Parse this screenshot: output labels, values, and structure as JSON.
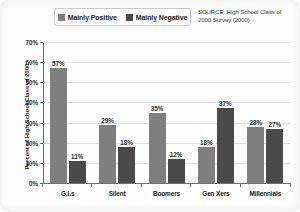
{
  "chart_data": {
    "type": "bar",
    "title": "",
    "xlabel": "",
    "ylabel": "Percent of High School Class of 2000",
    "ylim": [
      0,
      70
    ],
    "ytick_labels": [
      "70%",
      "60%",
      "50%",
      "40%",
      "30%",
      "20%",
      "10%",
      "0%"
    ],
    "ytick_values": [
      70,
      60,
      50,
      40,
      30,
      20,
      10,
      0
    ],
    "grid": true,
    "legend_position": "top-center",
    "categories": [
      "G.I.s",
      "Silent",
      "Boomers",
      "Gen Xers",
      "Millennials"
    ],
    "series": [
      {
        "name": "Mainly Positive",
        "color": "#7f7f7f",
        "values": [
          57,
          29,
          35,
          18,
          28
        ],
        "labels": [
          "57%",
          "29%",
          "35%",
          "18%",
          "28%"
        ]
      },
      {
        "name": "Mainly Negative",
        "color": "#4a4a4a",
        "values": [
          11,
          18,
          12,
          37,
          27
        ],
        "labels": [
          "11%",
          "18%",
          "12%",
          "37%",
          "27%"
        ]
      }
    ],
    "source_note": "SOURCE: High School Class of 2000 Survey (2000)"
  },
  "legend": {
    "items": [
      {
        "label": "Mainly Positive"
      },
      {
        "label": "Mainly Negative"
      }
    ]
  },
  "source": {
    "text": "SOURCE: High School Class of 2000 Survey (2000)"
  },
  "axes": {
    "y_title": "Percent of High School Class of 2000"
  }
}
